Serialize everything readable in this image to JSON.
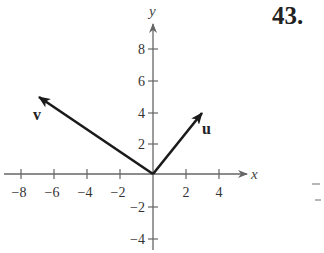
{
  "problem_number": "43.",
  "axes": {
    "x_label": "x",
    "y_label": "y",
    "x_ticks": [
      "−8",
      "−6",
      "−4",
      "−2",
      "2",
      "4"
    ],
    "x_tick_values": [
      -8,
      -6,
      -4,
      -2,
      2,
      4
    ],
    "y_ticks": [
      "8",
      "6",
      "4",
      "2",
      "−2",
      "−4"
    ],
    "y_tick_values": [
      8,
      6,
      4,
      2,
      -2,
      -4
    ]
  },
  "vectors": [
    {
      "name": "u",
      "from": [
        0,
        0
      ],
      "to": [
        3,
        4
      ]
    },
    {
      "name": "v",
      "from": [
        0,
        0
      ],
      "to": [
        -7,
        5
      ]
    }
  ],
  "colors": {
    "vector": "#1a1a1a",
    "axis": "#666666",
    "text": "#333333"
  }
}
